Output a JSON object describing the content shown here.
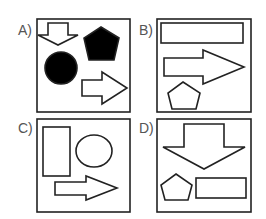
{
  "options": [
    {
      "label": "A)",
      "shapes": [
        "down-arrow-outline",
        "black-pentagon",
        "black-circle",
        "right-arrow-outline"
      ]
    },
    {
      "label": "B)",
      "shapes": [
        "wide-rectangle-outline",
        "right-arrow-outline",
        "pentagon-outline"
      ]
    },
    {
      "label": "C)",
      "shapes": [
        "tall-rectangle-outline",
        "circle-outline",
        "right-arrow-outline"
      ]
    },
    {
      "label": "D)",
      "shapes": [
        "down-arrow-outline",
        "pentagon-outline",
        "rectangle-outline"
      ]
    }
  ],
  "colors": {
    "stroke": "#222222",
    "fill_dark": "#000000",
    "label": "#555555"
  }
}
